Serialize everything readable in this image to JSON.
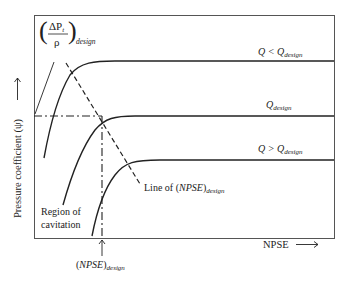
{
  "diagram": {
    "type": "pump-cavitation-characteristic",
    "y_axis": {
      "label": "Pressure coefficient (ψ)",
      "arrow": "up-arrow"
    },
    "x_axis": {
      "label": "NPSE",
      "arrow": "right-arrow"
    },
    "top_label": {
      "numerator": "ΔP",
      "numerator_sub": "t",
      "denominator": "ρ",
      "subscript": "design"
    },
    "curves": [
      {
        "name": "Q < Q",
        "label_main": "Q < Q",
        "label_sub": "design"
      },
      {
        "name": "Q design",
        "label_main": "Q",
        "label_sub": "design"
      },
      {
        "name": "Q > Q",
        "label_main": "Q > Q",
        "label_sub": "design"
      }
    ],
    "line_label": {
      "prefix": "Line of (",
      "main": "NPSE",
      "suffix": ")",
      "sub": "design"
    },
    "region_label": {
      "line1": "Region of",
      "line2": "cavitation"
    },
    "npse_design_label": {
      "open": "(",
      "main": "NPSE",
      "close": ")",
      "sub": "design"
    }
  }
}
